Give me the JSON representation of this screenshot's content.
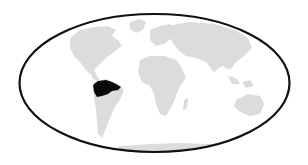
{
  "map": {
    "projection": "elliptical world map",
    "colors": {
      "background": "#ffffff",
      "land": "#dcdcdc",
      "highlight": "#0a0a0a",
      "outline": "#111111"
    },
    "highlighted_region": "northern South America (Amazon basin)",
    "landmasses": [
      "North America",
      "Greenland",
      "South America",
      "Europe",
      "Africa",
      "Asia",
      "Australia",
      "Antarctica"
    ]
  }
}
